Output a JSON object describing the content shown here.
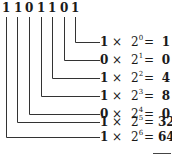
{
  "diagram": {
    "binary_digits": [
      "1",
      "1",
      "0",
      "1",
      "1",
      "0",
      "1"
    ],
    "multiply_symbol": "×",
    "base": "2",
    "equals_symbol": "=",
    "rows": [
      {
        "digit": "1",
        "exponent": "0",
        "value": "1"
      },
      {
        "digit": "0",
        "exponent": "1",
        "value": "0"
      },
      {
        "digit": "1",
        "exponent": "2",
        "value": "4"
      },
      {
        "digit": "1",
        "exponent": "3",
        "value": "8"
      },
      {
        "digit": "0",
        "exponent": "4",
        "value": "0"
      },
      {
        "digit": "1",
        "exponent": "5",
        "value": "32"
      },
      {
        "digit": "1",
        "exponent": "6",
        "value": "64"
      }
    ]
  }
}
